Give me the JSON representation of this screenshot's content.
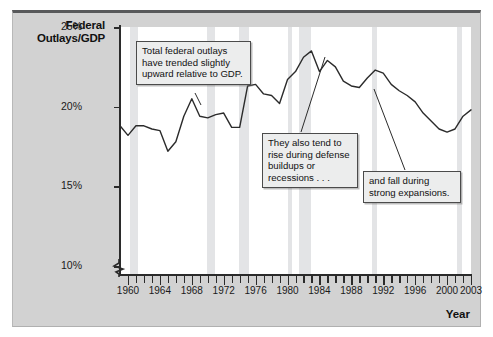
{
  "figure": {
    "y_axis_title": "Federal Outlays/GDP",
    "x_axis_title": "Year"
  },
  "callouts": [
    {
      "id": "callout-1",
      "text": "Total federal outlays have trended slightly upward relative to GDP."
    },
    {
      "id": "callout-2",
      "text": "They also tend to rise during defense buildups or recessions . . ."
    },
    {
      "id": "callout-3",
      "text": "and fall during strong expansions."
    }
  ],
  "chart_data": {
    "type": "line",
    "title": "",
    "subtitle": "",
    "xlabel": "Year",
    "ylabel": "Federal Outlays/GDP",
    "xlim": [
      1959,
      2003
    ],
    "ylim": [
      9.5,
      25
    ],
    "y_axis_break": true,
    "grid": false,
    "legend": null,
    "ytick_labels": [
      "25%",
      "20%",
      "15%",
      "10%"
    ],
    "ytick_values": [
      25,
      20,
      15,
      10
    ],
    "xtick_labels": [
      "1960",
      "1964",
      "1968",
      "1972",
      "1976",
      "1980",
      "1984",
      "1988",
      "1992",
      "1996",
      "2000",
      "2003"
    ],
    "xtick_values": [
      1960,
      1964,
      1968,
      1972,
      1976,
      1980,
      1984,
      1988,
      1992,
      1996,
      2000,
      2003
    ],
    "x": [
      1959,
      1960,
      1961,
      1962,
      1963,
      1964,
      1965,
      1966,
      1967,
      1968,
      1969,
      1970,
      1971,
      1972,
      1973,
      1974,
      1975,
      1976,
      1977,
      1978,
      1979,
      1980,
      1981,
      1982,
      1983,
      1984,
      1985,
      1986,
      1987,
      1988,
      1989,
      1990,
      1991,
      1992,
      1993,
      1994,
      1995,
      1996,
      1997,
      1998,
      1999,
      2000,
      2001,
      2002,
      2003
    ],
    "values": [
      18.8,
      18.2,
      18.8,
      18.8,
      18.6,
      18.5,
      17.2,
      17.8,
      19.4,
      20.5,
      19.4,
      19.3,
      19.5,
      19.6,
      18.7,
      18.7,
      21.3,
      21.4,
      20.8,
      20.7,
      20.2,
      21.7,
      22.2,
      23.1,
      23.5,
      22.2,
      22.9,
      22.5,
      21.6,
      21.3,
      21.2,
      21.8,
      22.3,
      22.1,
      21.4,
      21.0,
      20.7,
      20.3,
      19.6,
      19.1,
      18.6,
      18.4,
      18.6,
      19.4,
      19.8
    ],
    "recession_bands": [
      {
        "start": 1960.3,
        "end": 1961.2
      },
      {
        "start": 1969.9,
        "end": 1970.9
      },
      {
        "start": 1973.9,
        "end": 1975.2
      },
      {
        "start": 1980.0,
        "end": 1980.6
      },
      {
        "start": 1981.5,
        "end": 1982.9
      },
      {
        "start": 1990.6,
        "end": 1991.2
      },
      {
        "start": 2001.2,
        "end": 2001.9
      }
    ],
    "colors": {
      "line": "#2b2b2b",
      "plot_background": "#ffffff",
      "figure_background": "#d2d2d2",
      "recession_band": "#e3e4e6",
      "callout_background": "#eceded",
      "axis": "#2b2b2b"
    }
  }
}
